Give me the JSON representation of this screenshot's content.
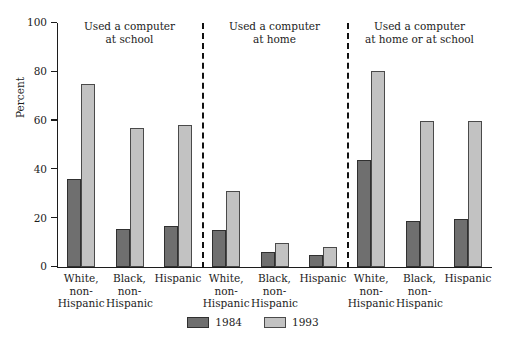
{
  "chart_data": {
    "type": "bar",
    "title": "",
    "xlabel": "",
    "ylabel": "Percent",
    "ylim": [
      0,
      100
    ],
    "yticks": [
      0,
      20,
      40,
      60,
      80,
      100
    ],
    "ytick_labels": [
      "0",
      "20",
      "40",
      "60",
      "80",
      "100"
    ],
    "grid": false,
    "legend_position": "bottom-center",
    "categories": [
      "White,\nnon-\nHispanic",
      "Black,\nnon-\nHispanic",
      "Hispanic"
    ],
    "series": [
      {
        "name": "1984",
        "color": "#6f6f6f"
      },
      {
        "name": "1993",
        "color": "#c2c2c2"
      }
    ],
    "panels": [
      {
        "title": "Used a computer\nat school",
        "title_lines": [
          "Used a computer",
          "at school"
        ],
        "categories": [
          "White,\nnon-\nHispanic",
          "Black,\nnon-\nHispanic",
          "Hispanic"
        ],
        "series": [
          {
            "name": "1984",
            "values": [
              36,
              15.5,
              17
            ]
          },
          {
            "name": "1993",
            "values": [
              75,
              57,
              58
            ]
          }
        ]
      },
      {
        "title": "Used a computer\nat home",
        "title_lines": [
          "Used a computer",
          "at home"
        ],
        "categories": [
          "White,\nnon-\nHispanic",
          "Black,\nnon-\nHispanic",
          "Hispanic"
        ],
        "series": [
          {
            "name": "1984",
            "values": [
              15,
              6,
              5
            ]
          },
          {
            "name": "1993",
            "values": [
              31,
              10,
              8
            ]
          }
        ]
      },
      {
        "title": "Used a computer\nat home or at school",
        "title_lines": [
          "Used a computer",
          "at home or at school"
        ],
        "categories": [
          "White,\nnon-\nHispanic",
          "Black,\nnon-\nHispanic",
          "Hispanic"
        ],
        "series": [
          {
            "name": "1984",
            "values": [
              44,
              19,
              19.5
            ]
          },
          {
            "name": "1993",
            "values": [
              80.5,
              60,
              60
            ]
          }
        ]
      }
    ]
  },
  "axis": {
    "y_title": "Percent",
    "tick_0": "0",
    "tick_20": "20",
    "tick_40": "40",
    "tick_60": "60",
    "tick_80": "80",
    "tick_100": "100"
  },
  "panel_titles": {
    "school_line1": "Used a computer",
    "school_line2": "at school",
    "home_line1": "Used a computer",
    "home_line2": "at home",
    "both_line1": "Used a computer",
    "both_line2": "at home or at school"
  },
  "cat_labels": {
    "white": "White,\nnon-\nHispanic",
    "black": "Black,\nnon-\nHispanic",
    "hispanic": "Hispanic"
  },
  "legend": {
    "items": [
      {
        "label": "1984",
        "color": "#6f6f6f"
      },
      {
        "label": "1993",
        "color": "#c2c2c2"
      }
    ],
    "label_1984": "1984",
    "label_1993": "1993"
  }
}
